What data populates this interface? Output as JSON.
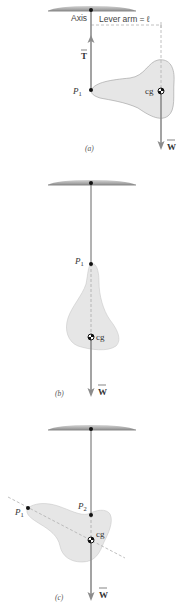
{
  "figure": {
    "colors": {
      "ceiling": "#9a9a9a",
      "body_fill": "#e6e6e6",
      "arrow": "#8c8c8c",
      "dashed": "#b0b0b0",
      "dot": "#111111",
      "line": "#555555"
    },
    "panel_a": {
      "caption": "(a)",
      "axis_label": "Axis",
      "lever_arm_label": "Lever arm = ℓ",
      "tension_label": "T",
      "point_label": "P",
      "point_sub": "1",
      "cg_label": "cg",
      "weight_label": "W"
    },
    "panel_b": {
      "caption": "(b)",
      "point_label": "P",
      "point_sub": "1",
      "cg_label": "cg",
      "weight_label": "W"
    },
    "panel_c": {
      "caption": "(c)",
      "point1_label": "P",
      "point1_sub": "1",
      "point2_label": "P",
      "point2_sub": "2",
      "cg_label": "cg",
      "weight_label": "W"
    }
  }
}
